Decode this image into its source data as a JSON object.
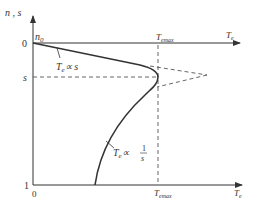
{
  "diagram": {
    "y_axis_label": "n , s",
    "x_axis_label": "T",
    "x_axis_label_sub": "e",
    "origin_top": "0",
    "origin_bottom": "0",
    "y_tick_s": "s",
    "y_tick_1": "1",
    "n0_label": "n",
    "n0_sub": "0",
    "temax_top": "T",
    "temax_bottom": "T",
    "temax_sub": "emax",
    "curve1_label": "T",
    "curve1_sub": "e",
    "curve1_rel": "∝ s",
    "curve2_label": "T",
    "curve2_sub": "e",
    "curve2_rel": "∝",
    "curve2_frac_num": "1",
    "curve2_frac_den": "s",
    "colors": {
      "line": "#333333",
      "dashed": "#555555"
    }
  }
}
